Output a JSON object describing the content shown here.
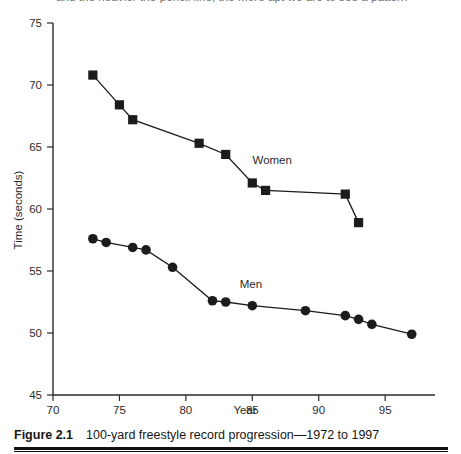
{
  "figure": {
    "clipped_header_text": "and the heavier the pencil line, the more apt we are to see a pattern",
    "caption_label": "Figure 2.1",
    "caption_text": "100-yard freestyle record progression—1972 to 1997"
  },
  "chart_data": {
    "type": "line",
    "title": "",
    "xlabel": "Year",
    "ylabel": "Time (seconds)",
    "xlim": [
      70,
      98
    ],
    "ylim": [
      45,
      75
    ],
    "xticks": [
      70,
      75,
      80,
      85,
      90,
      95
    ],
    "yticks": [
      45,
      50,
      55,
      60,
      65,
      70,
      75
    ],
    "grid": false,
    "legend_position": "inline-annotation",
    "series": [
      {
        "name": "Women",
        "marker": "square",
        "color": "#1c1c1c",
        "label_x": 86.5,
        "label_y": 63.6,
        "x": [
          73,
          75,
          76,
          81,
          83,
          85,
          86,
          92,
          93
        ],
        "values": [
          70.8,
          68.4,
          67.2,
          65.3,
          64.4,
          62.1,
          61.5,
          61.2,
          58.9
        ]
      },
      {
        "name": "Men",
        "marker": "circle",
        "color": "#1c1c1c",
        "label_x": 84.9,
        "label_y": 53.6,
        "x": [
          73,
          74,
          76,
          77,
          79,
          82,
          83,
          85,
          89,
          92,
          93,
          94,
          97
        ],
        "values": [
          57.6,
          57.3,
          56.9,
          56.7,
          55.3,
          52.6,
          52.5,
          52.2,
          51.8,
          51.4,
          51.1,
          50.7,
          49.9
        ]
      }
    ]
  }
}
